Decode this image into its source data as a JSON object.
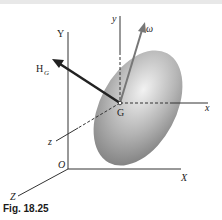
{
  "figure": {
    "caption": "Fig. 18.25",
    "labels": {
      "Y": "Y",
      "X": "X",
      "Z": "Z",
      "O": "O",
      "y": "y",
      "x": "x",
      "z": "z",
      "G": "G",
      "H": "H",
      "H_sub": "G",
      "omega": "ω"
    },
    "colors": {
      "axis": "#333333",
      "ellipsoid_light": "#e0e0e0",
      "ellipsoid_dark": "#8a8a8a",
      "arrow_H": "#222222",
      "arrow_omega": "#777777"
    }
  }
}
